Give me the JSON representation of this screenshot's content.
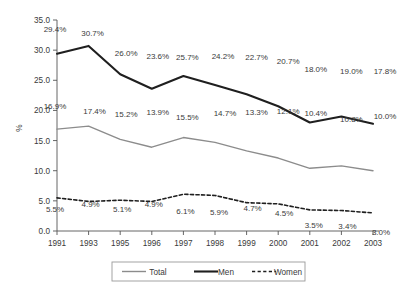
{
  "chart_data": {
    "type": "line",
    "title": "",
    "xlabel": "",
    "ylabel": "%",
    "categories": [
      "1991",
      "1993",
      "1995",
      "1996",
      "1997",
      "1998",
      "1999",
      "2000",
      "2001",
      "2002",
      "2003"
    ],
    "ylim": [
      0.0,
      35.0
    ],
    "ytick_labels": [
      "0.0",
      "5.0",
      "10.0",
      "15.0",
      "20.0",
      "25.0",
      "30.0",
      "35.0"
    ],
    "ytick_values": [
      0.0,
      5.0,
      10.0,
      15.0,
      20.0,
      25.0,
      30.0,
      35.0
    ],
    "grid": false,
    "legend_position": "bottom",
    "series": [
      {
        "name": "Total",
        "color": "#8c8c8c",
        "style": "solid",
        "width": 1.4,
        "values": [
          16.9,
          17.4,
          15.2,
          13.9,
          15.5,
          14.7,
          13.3,
          12.1,
          10.4,
          10.8,
          10.0
        ],
        "labels": [
          "16.9%",
          "17.4%",
          "15.2%",
          "13.9%",
          "15.5%",
          "14.7%",
          "13.3%",
          "12.1%",
          "10.4%",
          "10.8%",
          "10.0%"
        ]
      },
      {
        "name": "Men",
        "color": "#1f1f1f",
        "style": "solid",
        "width": 2.1,
        "values": [
          29.4,
          30.7,
          26.0,
          23.6,
          25.7,
          24.2,
          22.7,
          20.7,
          18.0,
          19.0,
          17.8
        ],
        "labels": [
          "29.4%",
          "30.7%",
          "26.0%",
          "23.6%",
          "25.7%",
          "24.2%",
          "22.7%",
          "20.7%",
          "18.0%",
          "19.0%",
          "17.8%"
        ]
      },
      {
        "name": "Women",
        "color": "#1f1f1f",
        "style": "dashed",
        "width": 1.6,
        "values": [
          5.5,
          4.9,
          5.1,
          4.9,
          6.1,
          5.9,
          4.7,
          4.5,
          3.5,
          3.4,
          3.0
        ],
        "labels": [
          "5.5%",
          "4.9%",
          "5.1%",
          "4.9%",
          "6.1%",
          "5.9%",
          "4.7%",
          "4.5%",
          "3.5%",
          "3.4%",
          "3.0%"
        ]
      }
    ]
  },
  "legend": {
    "items": [
      {
        "label": "Total",
        "color": "#8c8c8c",
        "style": "solid",
        "width": 1.4
      },
      {
        "label": "Men",
        "color": "#1f1f1f",
        "style": "solid",
        "width": 2.1
      },
      {
        "label": "Women",
        "color": "#1f1f1f",
        "style": "dashed",
        "width": 1.6
      }
    ]
  }
}
